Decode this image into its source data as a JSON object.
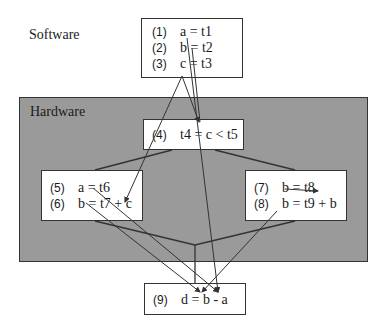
{
  "regions": {
    "software_label": "Software",
    "hardware_label": "Hardware"
  },
  "colors": {
    "hardware_fill": "#9a9a9a",
    "box_fill": "#ffffff",
    "stroke": "#333333"
  },
  "nodes": {
    "sw": {
      "lines": [
        {
          "num": "(1)",
          "stmt": "a = t1"
        },
        {
          "num": "(2)",
          "stmt": "b = t2"
        },
        {
          "num": "(3)",
          "stmt": "c = t3"
        }
      ]
    },
    "n4": {
      "lines": [
        {
          "num": "(4)",
          "stmt": "t4 = c < t5"
        }
      ]
    },
    "n56": {
      "lines": [
        {
          "num": "(5)",
          "stmt": "a = t6"
        },
        {
          "num": "(6)",
          "stmt": "b = t7 + c"
        }
      ]
    },
    "n78": {
      "lines": [
        {
          "num": "(7)",
          "stmt": "b = t8"
        },
        {
          "num": "(8)",
          "stmt": "b = t9 + b"
        }
      ]
    },
    "n9": {
      "lines": [
        {
          "num": "(9)",
          "stmt": "d = b - a"
        }
      ]
    }
  }
}
